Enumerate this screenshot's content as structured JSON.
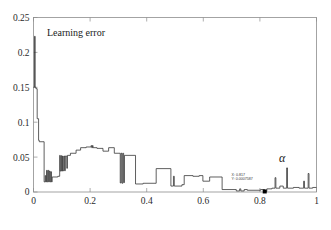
{
  "figure": {
    "background": "#ffffff",
    "frame_color": "#8d8d8d",
    "curve_color": "#2b2b2b",
    "annotation_label": "Learning error",
    "x_symbol": "α"
  },
  "datatip": {
    "x_line": "X: 0.817",
    "y_line": "Y: 0.0007587",
    "x_value": 0.817,
    "y_value": 0.0007587
  },
  "chart_data": {
    "type": "line",
    "title": "",
    "annotations": [
      {
        "text": "Learning error",
        "x": 0.07,
        "y": 0.228
      },
      {
        "text": "α",
        "x": 0.885,
        "y": 0.048
      },
      {
        "text": "X: 0.817",
        "x": 0.72,
        "y": 0.024
      },
      {
        "text": "Y: 0.0007587",
        "x": 0.72,
        "y": 0.017
      }
    ],
    "xlabel": "α",
    "ylabel": "",
    "xlim": [
      0,
      1
    ],
    "ylim": [
      0,
      0.25
    ],
    "xticks": [
      0,
      0.2,
      0.4,
      0.6,
      0.8,
      1
    ],
    "xticklabels": [
      "0",
      "0.2",
      "0.4",
      "0.6",
      "0.8",
      "1"
    ],
    "yticks": [
      0,
      0.05,
      0.1,
      0.15,
      0.2,
      0.25
    ],
    "yticklabels": [
      "0",
      "0.05",
      "0.1",
      "0.15",
      "0.2",
      "0.25"
    ],
    "grid": false,
    "legend": null,
    "series": [
      {
        "name": "Learning error",
        "color": "#2b2b2b",
        "x": [
          0.0,
          0.004,
          0.005,
          0.006,
          0.007,
          0.008,
          0.01,
          0.012,
          0.014,
          0.016,
          0.018,
          0.02,
          0.022,
          0.024,
          0.026,
          0.028,
          0.03,
          0.034,
          0.038,
          0.04,
          0.042,
          0.044,
          0.046,
          0.048,
          0.05,
          0.052,
          0.054,
          0.056,
          0.058,
          0.06,
          0.062,
          0.064,
          0.066,
          0.07,
          0.074,
          0.078,
          0.082,
          0.086,
          0.09,
          0.094,
          0.096,
          0.098,
          0.1,
          0.104,
          0.108,
          0.112,
          0.116,
          0.12,
          0.124,
          0.128,
          0.132,
          0.136,
          0.14,
          0.146,
          0.152,
          0.158,
          0.164,
          0.17,
          0.176,
          0.182,
          0.188,
          0.194,
          0.2,
          0.204,
          0.208,
          0.21,
          0.212,
          0.216,
          0.22,
          0.226,
          0.232,
          0.238,
          0.244,
          0.25,
          0.256,
          0.262,
          0.268,
          0.272,
          0.276,
          0.28,
          0.286,
          0.292,
          0.298,
          0.304,
          0.308,
          0.31,
          0.312,
          0.314,
          0.316,
          0.318,
          0.32,
          0.324,
          0.328,
          0.334,
          0.34,
          0.346,
          0.352,
          0.358,
          0.364,
          0.37,
          0.374,
          0.378,
          0.382,
          0.388,
          0.394,
          0.4,
          0.406,
          0.412,
          0.418,
          0.424,
          0.43,
          0.436,
          0.44,
          0.444,
          0.45,
          0.46,
          0.47,
          0.48,
          0.488,
          0.492,
          0.496,
          0.498,
          0.5,
          0.502,
          0.504,
          0.508,
          0.514,
          0.52,
          0.526,
          0.53,
          0.534,
          0.54,
          0.546,
          0.552,
          0.558,
          0.564,
          0.57,
          0.576,
          0.582,
          0.588,
          0.594,
          0.6,
          0.604,
          0.608,
          0.612,
          0.618,
          0.624,
          0.63,
          0.636,
          0.642,
          0.648,
          0.654,
          0.66,
          0.666,
          0.67,
          0.674,
          0.678,
          0.684,
          0.69,
          0.696,
          0.702,
          0.708,
          0.714,
          0.718,
          0.722,
          0.726,
          0.73,
          0.736,
          0.742,
          0.748,
          0.754,
          0.76,
          0.766,
          0.772,
          0.778,
          0.784,
          0.79,
          0.796,
          0.802,
          0.808,
          0.814,
          0.817,
          0.82,
          0.826,
          0.832,
          0.838,
          0.844,
          0.85,
          0.854,
          0.856,
          0.858,
          0.86,
          0.862,
          0.866,
          0.872,
          0.878,
          0.884,
          0.89,
          0.894,
          0.896,
          0.898,
          0.9,
          0.902,
          0.906,
          0.912,
          0.918,
          0.924,
          0.93,
          0.936,
          0.942,
          0.948,
          0.952,
          0.956,
          0.958,
          0.96,
          0.962,
          0.966,
          0.97,
          0.974,
          0.976,
          0.978,
          0.98,
          0.982,
          0.986,
          0.99,
          0.994,
          1.0
        ],
        "y": [
          0.15,
          0.15,
          0.223,
          0.223,
          0.175,
          0.15,
          0.15,
          0.148,
          0.148,
          0.12,
          0.1,
          0.09,
          0.08,
          0.074,
          0.074,
          0.072,
          0.072,
          0.072,
          0.072,
          0.04,
          0.022,
          0.014,
          0.014,
          0.016,
          0.03,
          0.014,
          0.03,
          0.016,
          0.03,
          0.014,
          0.028,
          0.016,
          0.016,
          0.016,
          0.016,
          0.016,
          0.022,
          0.022,
          0.022,
          0.022,
          0.022,
          0.022,
          0.022,
          0.03,
          0.03,
          0.03,
          0.03,
          0.03,
          0.052,
          0.03,
          0.052,
          0.034,
          0.052,
          0.052,
          0.052,
          0.052,
          0.052,
          0.052,
          0.052,
          0.052,
          0.052,
          0.052,
          0.052,
          0.052,
          0.052,
          0.063,
          0.052,
          0.058,
          0.058,
          0.058,
          0.058,
          0.058,
          0.058,
          0.058,
          0.058,
          0.063,
          0.063,
          0.063,
          0.063,
          0.063,
          0.063,
          0.063,
          0.063,
          0.063,
          0.066,
          0.063,
          0.067,
          0.063,
          0.067,
          0.063,
          0.063,
          0.063,
          0.063,
          0.063,
          0.063,
          0.063,
          0.063,
          0.063,
          0.063,
          0.063,
          0.063,
          0.063,
          0.063,
          0.063,
          0.063,
          0.063,
          0.063,
          0.063,
          0.063,
          0.063,
          0.06,
          0.06,
          0.06,
          0.06,
          0.06,
          0.06,
          0.06,
          0.06,
          0.06,
          0.06,
          0.06,
          0.06,
          0.06,
          0.06,
          0.06,
          0.06,
          0.06,
          0.06,
          0.06,
          0.06,
          0.06,
          0.06,
          0.06,
          0.06,
          0.06,
          0.06,
          0.06,
          0.06,
          0.06,
          0.06,
          0.06,
          0.06,
          0.06,
          0.06,
          0.06,
          0.06,
          0.06,
          0.06,
          0.06,
          0.06,
          0.06,
          0.06,
          0.06,
          0.06,
          0.06,
          0.06,
          0.06,
          0.06,
          0.06,
          0.06,
          0.06,
          0.06,
          0.06,
          0.06,
          0.06,
          0.06,
          0.06,
          0.06,
          0.06,
          0.06,
          0.06,
          0.06,
          0.06,
          0.06,
          0.06,
          0.06,
          0.06,
          0.06,
          0.06,
          0.06,
          0.06,
          0.0008,
          0.06,
          0.06,
          0.06,
          0.06,
          0.06,
          0.06,
          0.06,
          0.06,
          0.06,
          0.06,
          0.06,
          0.06,
          0.06,
          0.06,
          0.06,
          0.06,
          0.06,
          0.06,
          0.06,
          0.06,
          0.06,
          0.06,
          0.06,
          0.06,
          0.06,
          0.06,
          0.06,
          0.06,
          0.06,
          0.06,
          0.06,
          0.06,
          0.06,
          0.06,
          0.06,
          0.06,
          0.06,
          0.06,
          0.06,
          0.06,
          0.06,
          0.06,
          0.06,
          0.06,
          0.06
        ],
        "note": "stepwise piecewise-constant learning-error curve"
      }
    ],
    "path_segments": {
      "comment": "Explicit polyline vertices in data coords used for rendering the stepped trace.",
      "points": [
        [
          0.0,
          0.15
        ],
        [
          0.0035,
          0.15
        ],
        [
          0.0035,
          0.223
        ],
        [
          0.006,
          0.223
        ],
        [
          0.006,
          0.15
        ],
        [
          0.0085,
          0.15
        ],
        [
          0.0085,
          0.148
        ],
        [
          0.013,
          0.148
        ],
        [
          0.013,
          0.105
        ],
        [
          0.018,
          0.105
        ],
        [
          0.018,
          0.074
        ],
        [
          0.0205,
          0.074
        ],
        [
          0.0205,
          0.072
        ],
        [
          0.0375,
          0.072
        ],
        [
          0.0375,
          0.0145
        ],
        [
          0.0415,
          0.0145
        ],
        [
          0.0415,
          0.0235
        ],
        [
          0.0435,
          0.0235
        ],
        [
          0.0435,
          0.0145
        ],
        [
          0.046,
          0.0145
        ],
        [
          0.046,
          0.031
        ],
        [
          0.0485,
          0.031
        ],
        [
          0.0485,
          0.0145
        ],
        [
          0.051,
          0.0145
        ],
        [
          0.051,
          0.031
        ],
        [
          0.0535,
          0.031
        ],
        [
          0.0535,
          0.0145
        ],
        [
          0.056,
          0.0145
        ],
        [
          0.056,
          0.03
        ],
        [
          0.0585,
          0.03
        ],
        [
          0.0585,
          0.0145
        ],
        [
          0.061,
          0.0145
        ],
        [
          0.061,
          0.029
        ],
        [
          0.0635,
          0.029
        ],
        [
          0.0635,
          0.0145
        ],
        [
          0.066,
          0.0145
        ],
        [
          0.066,
          0.0215
        ],
        [
          0.086,
          0.0215
        ],
        [
          0.086,
          0.0225
        ],
        [
          0.0925,
          0.0225
        ],
        [
          0.0925,
          0.0525
        ],
        [
          0.0945,
          0.0525
        ],
        [
          0.0945,
          0.03
        ],
        [
          0.0975,
          0.03
        ],
        [
          0.0975,
          0.052
        ],
        [
          0.0995,
          0.052
        ],
        [
          0.0995,
          0.03
        ],
        [
          0.1025,
          0.03
        ],
        [
          0.1025,
          0.0515
        ],
        [
          0.1045,
          0.0515
        ],
        [
          0.1045,
          0.0305
        ],
        [
          0.1075,
          0.0305
        ],
        [
          0.1075,
          0.0515
        ],
        [
          0.11,
          0.0515
        ],
        [
          0.11,
          0.0305
        ],
        [
          0.1125,
          0.0305
        ],
        [
          0.1125,
          0.0515
        ],
        [
          0.1175,
          0.0515
        ],
        [
          0.1175,
          0.034
        ],
        [
          0.12,
          0.034
        ],
        [
          0.12,
          0.0525
        ],
        [
          0.1305,
          0.0525
        ],
        [
          0.1305,
          0.0555
        ],
        [
          0.1505,
          0.0555
        ],
        [
          0.1505,
          0.06
        ],
        [
          0.1665,
          0.06
        ],
        [
          0.1665,
          0.0635
        ],
        [
          0.186,
          0.0635
        ],
        [
          0.186,
          0.0645
        ],
        [
          0.2035,
          0.0645
        ],
        [
          0.2035,
          0.0665
        ],
        [
          0.2055,
          0.0665
        ],
        [
          0.2055,
          0.0635
        ],
        [
          0.2085,
          0.0635
        ],
        [
          0.2085,
          0.0665
        ],
        [
          0.2105,
          0.0665
        ],
        [
          0.2105,
          0.0635
        ],
        [
          0.2245,
          0.0635
        ],
        [
          0.2245,
          0.0625
        ],
        [
          0.2455,
          0.0625
        ],
        [
          0.2455,
          0.0585
        ],
        [
          0.2655,
          0.0585
        ],
        [
          0.2655,
          0.0635
        ],
        [
          0.2855,
          0.0635
        ],
        [
          0.2855,
          0.0555
        ],
        [
          0.3065,
          0.0555
        ],
        [
          0.3065,
          0.013
        ],
        [
          0.3095,
          0.013
        ],
        [
          0.3095,
          0.0555
        ],
        [
          0.3125,
          0.0555
        ],
        [
          0.3125,
          0.0125
        ],
        [
          0.3155,
          0.0125
        ],
        [
          0.3155,
          0.0555
        ],
        [
          0.3185,
          0.0555
        ],
        [
          0.3185,
          0.0135
        ],
        [
          0.3215,
          0.0135
        ],
        [
          0.3215,
          0.0525
        ],
        [
          0.3605,
          0.0525
        ],
        [
          0.3605,
          0.0115
        ],
        [
          0.3875,
          0.0115
        ],
        [
          0.3875,
          0.0125
        ],
        [
          0.4335,
          0.0125
        ],
        [
          0.4335,
          0.0335
        ],
        [
          0.4855,
          0.0335
        ],
        [
          0.4855,
          0.0085
        ],
        [
          0.4945,
          0.0085
        ],
        [
          0.4945,
          0.0225
        ],
        [
          0.4975,
          0.0225
        ],
        [
          0.4975,
          0.0085
        ],
        [
          0.5245,
          0.0085
        ],
        [
          0.5245,
          0.0105
        ],
        [
          0.5325,
          0.0105
        ],
        [
          0.5325,
          0.0235
        ],
        [
          0.5635,
          0.0235
        ],
        [
          0.5635,
          0.0225
        ],
        [
          0.5855,
          0.0225
        ],
        [
          0.5855,
          0.0235
        ],
        [
          0.5985,
          0.0235
        ],
        [
          0.5985,
          0.0155
        ],
        [
          0.6225,
          0.0155
        ],
        [
          0.6225,
          0.0215
        ],
        [
          0.6665,
          0.0215
        ],
        [
          0.6665,
          0.0035
        ],
        [
          0.7165,
          0.0035
        ],
        [
          0.7165,
          0.0015
        ],
        [
          0.7285,
          0.0015
        ],
        [
          0.7285,
          0.0045
        ],
        [
          0.7325,
          0.0045
        ],
        [
          0.7325,
          0.0015
        ],
        [
          0.7445,
          0.0015
        ],
        [
          0.7445,
          0.0035
        ],
        [
          0.7555,
          0.0035
        ],
        [
          0.7555,
          0.0025
        ],
        [
          0.8025,
          0.0025
        ],
        [
          0.8025,
          0.0035
        ],
        [
          0.8165,
          0.0035
        ],
        [
          0.8165,
          0.0008
        ],
        [
          0.8245,
          0.0008
        ],
        [
          0.8245,
          0.0045
        ],
        [
          0.8425,
          0.0045
        ],
        [
          0.8425,
          0.0055
        ],
        [
          0.8535,
          0.0055
        ],
        [
          0.8535,
          0.0205
        ],
        [
          0.8565,
          0.0205
        ],
        [
          0.8565,
          0.0055
        ],
        [
          0.8705,
          0.0055
        ],
        [
          0.8705,
          0.0085
        ],
        [
          0.8825,
          0.0085
        ],
        [
          0.8825,
          0.0055
        ],
        [
          0.8945,
          0.0055
        ],
        [
          0.8945,
          0.0345
        ],
        [
          0.8975,
          0.0345
        ],
        [
          0.8975,
          0.0055
        ],
        [
          0.9185,
          0.0055
        ],
        [
          0.9185,
          0.0065
        ],
        [
          0.9385,
          0.0065
        ],
        [
          0.9385,
          0.0055
        ],
        [
          0.9545,
          0.0055
        ],
        [
          0.9545,
          0.0155
        ],
        [
          0.9575,
          0.0155
        ],
        [
          0.9575,
          0.0055
        ],
        [
          0.9705,
          0.0055
        ],
        [
          0.9705,
          0.0265
        ],
        [
          0.9735,
          0.0265
        ],
        [
          0.9735,
          0.0055
        ],
        [
          0.9865,
          0.0055
        ],
        [
          0.9865,
          0.0065
        ],
        [
          1.0,
          0.0065
        ]
      ]
    }
  }
}
